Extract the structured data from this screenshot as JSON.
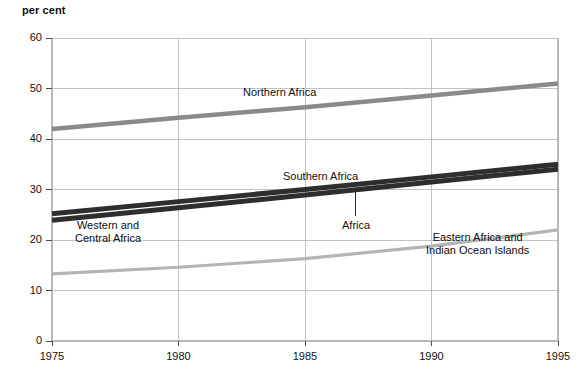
{
  "chart_data": {
    "type": "line",
    "title": "per cent",
    "xlabel": "",
    "ylabel": "per cent",
    "xlim": [
      1975,
      1995
    ],
    "ylim": [
      0,
      60
    ],
    "grid": true,
    "legend_position": "inline-annotations",
    "x": [
      1975,
      1980,
      1985,
      1990,
      1995
    ],
    "xticks": [
      "1975",
      "1980",
      "1985",
      "1990",
      "1995"
    ],
    "yticks": [
      "0",
      "10",
      "20",
      "30",
      "40",
      "50",
      "60"
    ],
    "series": [
      {
        "name": "Northern Africa",
        "values": [
          42.0,
          44.2,
          46.3,
          48.6,
          51.0
        ],
        "color": "#8a8a8a",
        "width": 4.5
      },
      {
        "name": "Southern Africa",
        "values": [
          25.2,
          27.6,
          30.0,
          32.5,
          35.0
        ],
        "color": "#2e2e2e",
        "width": 5.0
      },
      {
        "name": "Africa",
        "values": [
          23.9,
          26.4,
          28.9,
          31.5,
          34.0
        ],
        "color": "#2e2e2e",
        "width": 5.0
      },
      {
        "name": "Eastern Africa and Indian Ocean Islands",
        "values": [
          13.3,
          14.6,
          16.3,
          18.8,
          22.0
        ],
        "color": "#b4b4b4",
        "width": 3.2
      }
    ],
    "annotations": [
      {
        "text": "Northern Africa",
        "x": 1984.0,
        "y": 49.2
      },
      {
        "text": "Southern Africa",
        "x": 1985.6,
        "y": 32.6
      },
      {
        "text": "Africa",
        "x": 1987.0,
        "y": 22.8
      },
      {
        "text": "Western and\nCentral Africa",
        "x": 1977.2,
        "y": 21.6
      },
      {
        "text": "Eastern Africa and\nIndian Ocean Islands",
        "x": 1991.8,
        "y": 19.4
      }
    ]
  },
  "axis": {
    "y_title": "per cent",
    "y_tick_labels": [
      "60",
      "50",
      "40",
      "30",
      "20",
      "10",
      "0"
    ],
    "x_tick_labels": [
      "1975",
      "1980",
      "1985",
      "1990",
      "1995"
    ]
  },
  "labels": {
    "northern_africa": "Northern Africa",
    "southern_africa": "Southern Africa",
    "africa": "Africa",
    "western_central_africa_line1": "Western and",
    "western_central_africa_line2": "Central Africa",
    "eastern_africa_line1": "Eastern Africa and",
    "eastern_africa_line2": "Indian Ocean Islands"
  },
  "colors": {
    "northern_africa": "#8a8a8a",
    "southern_africa": "#2e2e2e",
    "africa": "#2e2e2e",
    "eastern_africa": "#b4b4b4",
    "grid": "#b9b9b9",
    "axis": "#4a4a4a",
    "text": "#121212"
  }
}
